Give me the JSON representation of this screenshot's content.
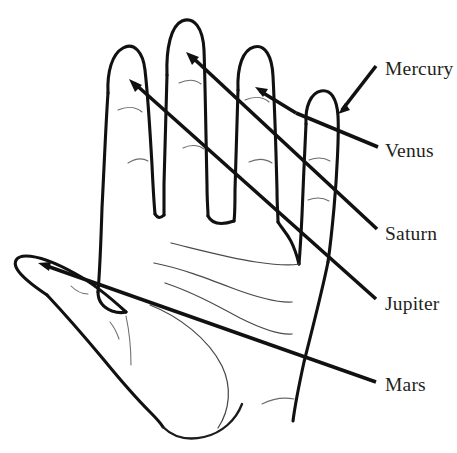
{
  "figure": {
    "background_color": "#ffffff",
    "ink_color": "#111111",
    "label_color": "#231f20",
    "width": 457,
    "height": 453
  },
  "labels": [
    {
      "name": "mercury",
      "text": "Mercury",
      "x": 385,
      "y": 59,
      "points_to": "little-finger",
      "leader_start": [
        358,
        88
      ],
      "leader_end": [
        340,
        112
      ],
      "arrow_tip": [
        338,
        114
      ]
    },
    {
      "name": "venus",
      "text": "Venus",
      "x": 385,
      "y": 141,
      "points_to": "thumb-mount",
      "leader_start": [
        378,
        146
      ],
      "leader_end": [
        327,
        116
      ],
      "arrow_tip": [
        325,
        115
      ]
    },
    {
      "name": "saturn",
      "text": "Saturn",
      "x": 385,
      "y": 224,
      "points_to": "middle-finger",
      "leader_start": [
        377,
        229
      ],
      "leader_end": [
        190,
        55
      ],
      "arrow_tip": [
        186,
        52
      ]
    },
    {
      "name": "jupiter",
      "text": "Jupiter",
      "x": 385,
      "y": 294,
      "points_to": "index-finger",
      "leader_start": [
        376,
        299
      ],
      "leader_end": [
        133,
        82
      ],
      "arrow_tip": [
        129,
        79
      ]
    },
    {
      "name": "mars",
      "text": "Mars",
      "x": 385,
      "y": 375,
      "points_to": "thumb",
      "leader_start": [
        376,
        382
      ],
      "leader_end": [
        43,
        265
      ],
      "arrow_tip": [
        38,
        263
      ]
    }
  ],
  "ring_finger_leader": {
    "name": "ring-finger-leader",
    "leader_start": [
      378,
      148
    ],
    "leader_end": [
      259,
      90
    ],
    "arrow_tip": [
      255,
      87
    ]
  }
}
